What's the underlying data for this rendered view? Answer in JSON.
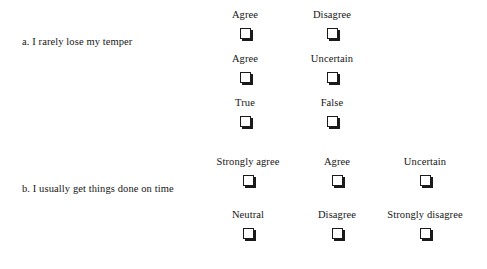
{
  "figure": {
    "background_color": "#ffffff",
    "text_color": "#151515",
    "checkbox": {
      "icon": "empty-checkbox-icon",
      "face_color": "#ffffff",
      "border_color": "#1a1a1a",
      "shadow_color": "#1a1a1a"
    }
  },
  "questions": [
    {
      "id": "a",
      "label": "a. I rarely lose my temper",
      "columns": 2,
      "column_centers": [
        245,
        332
      ],
      "rows": [
        {
          "options": [
            "Agree",
            "Disagree"
          ]
        },
        {
          "options": [
            "Agree",
            "Uncertain"
          ]
        },
        {
          "options": [
            "True",
            "False"
          ]
        }
      ]
    },
    {
      "id": "b",
      "label": "b. I usually get things done on time",
      "columns": 3,
      "column_centers": [
        248,
        337,
        425
      ],
      "rows": [
        {
          "options": [
            "Strongly agree",
            "Agree",
            "Uncertain"
          ]
        },
        {
          "options": [
            "Neutral",
            "Disagree",
            "Strongly disagree"
          ]
        }
      ]
    }
  ]
}
